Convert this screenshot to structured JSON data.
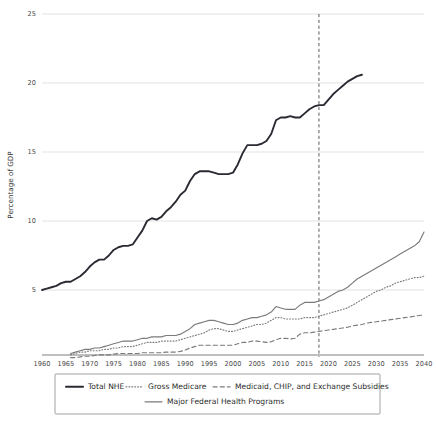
{
  "chart_data": {
    "type": "line",
    "title": "",
    "xlabel": "",
    "ylabel": "Percentage of GDP",
    "xlim": [
      1960,
      2040
    ],
    "ylim": [
      0,
      25
    ],
    "grid": true,
    "legend_position": "bottom",
    "y_ticks": [
      "5",
      "10",
      "15",
      "20",
      "25"
    ],
    "y_tick_values": [
      5,
      10,
      15,
      20,
      25
    ],
    "x_ticks": [
      "1960",
      "1965",
      "1970",
      "1975",
      "1980",
      "1985",
      "1990",
      "1995",
      "2000",
      "2005",
      "2010",
      "2015",
      "2020",
      "2025",
      "2030",
      "2035",
      "2040"
    ],
    "x_tick_values": [
      1960,
      1965,
      1970,
      1975,
      1980,
      1985,
      1990,
      1995,
      2000,
      2005,
      2010,
      2015,
      2020,
      2025,
      2030,
      2035,
      2040
    ],
    "annotations": [
      {
        "name": "projection-divider",
        "type": "vline",
        "x": 2018,
        "style": "dashed"
      }
    ],
    "series": [
      {
        "name": "Total NHE",
        "style": "solid",
        "color": "#2a2a33",
        "width": 1.9,
        "x": [
          1960,
          1961,
          1962,
          1963,
          1964,
          1965,
          1966,
          1967,
          1968,
          1969,
          1970,
          1971,
          1972,
          1973,
          1974,
          1975,
          1976,
          1977,
          1978,
          1979,
          1980,
          1981,
          1982,
          1983,
          1984,
          1985,
          1986,
          1987,
          1988,
          1989,
          1990,
          1991,
          1992,
          1993,
          1994,
          1995,
          1996,
          1997,
          1998,
          1999,
          2000,
          2001,
          2002,
          2003,
          2004,
          2005,
          2006,
          2007,
          2008,
          2009,
          2010,
          2011,
          2012,
          2013,
          2014,
          2015,
          2016,
          2017,
          2018,
          2019,
          2020,
          2021,
          2022,
          2023,
          2024,
          2025,
          2026,
          2027
        ],
        "values": [
          5.0,
          5.1,
          5.2,
          5.3,
          5.5,
          5.6,
          5.6,
          5.8,
          6.0,
          6.3,
          6.7,
          7.0,
          7.2,
          7.2,
          7.5,
          7.9,
          8.1,
          8.2,
          8.2,
          8.3,
          8.8,
          9.3,
          10.0,
          10.2,
          10.1,
          10.3,
          10.7,
          11.0,
          11.4,
          11.9,
          12.2,
          12.9,
          13.4,
          13.6,
          13.6,
          13.6,
          13.5,
          13.4,
          13.4,
          13.4,
          13.5,
          14.1,
          14.9,
          15.5,
          15.5,
          15.5,
          15.6,
          15.8,
          16.3,
          17.3,
          17.5,
          17.5,
          17.6,
          17.5,
          17.5,
          17.8,
          18.1,
          18.3,
          18.4,
          18.4,
          18.8,
          19.2,
          19.5,
          19.8,
          20.1,
          20.3,
          20.5,
          20.6
        ]
      },
      {
        "name": "Major Federal Health Programs",
        "style": "solid",
        "color": "#7b7b7b",
        "width": 1.15,
        "x": [
          1966,
          1967,
          1968,
          1969,
          1970,
          1971,
          1972,
          1973,
          1974,
          1975,
          1976,
          1977,
          1978,
          1979,
          1980,
          1981,
          1982,
          1983,
          1984,
          1985,
          1986,
          1987,
          1988,
          1989,
          1990,
          1991,
          1992,
          1993,
          1994,
          1995,
          1996,
          1997,
          1998,
          1999,
          2000,
          2001,
          2002,
          2003,
          2004,
          2005,
          2006,
          2007,
          2008,
          2009,
          2010,
          2011,
          2012,
          2013,
          2014,
          2015,
          2016,
          2017,
          2018,
          2019,
          2020,
          2021,
          2022,
          2023,
          2024,
          2025,
          2026,
          2027,
          2028,
          2029,
          2030,
          2031,
          2032,
          2033,
          2034,
          2035,
          2036,
          2037,
          2038,
          2039,
          2040
        ],
        "values": [
          0.4,
          0.5,
          0.6,
          0.7,
          0.7,
          0.8,
          0.8,
          0.9,
          1.0,
          1.1,
          1.2,
          1.3,
          1.3,
          1.3,
          1.4,
          1.5,
          1.5,
          1.6,
          1.6,
          1.6,
          1.7,
          1.7,
          1.7,
          1.8,
          2.0,
          2.2,
          2.5,
          2.6,
          2.7,
          2.8,
          2.8,
          2.7,
          2.6,
          2.5,
          2.5,
          2.6,
          2.8,
          2.9,
          3.0,
          3.0,
          3.1,
          3.2,
          3.4,
          3.8,
          3.7,
          3.6,
          3.6,
          3.6,
          3.9,
          4.1,
          4.1,
          4.1,
          4.2,
          4.3,
          4.5,
          4.7,
          4.9,
          5.0,
          5.2,
          5.5,
          5.8,
          6.0,
          6.2,
          6.4,
          6.6,
          6.8,
          7.0,
          7.2,
          7.4,
          7.6,
          7.8,
          8.0,
          8.2,
          8.5,
          9.2
        ]
      },
      {
        "name": "Gross Medicare",
        "style": "dotted",
        "color": "#7b7b7b",
        "width": 1.15,
        "x": [
          1966,
          1967,
          1968,
          1969,
          1970,
          1971,
          1972,
          1973,
          1974,
          1975,
          1976,
          1977,
          1978,
          1979,
          1980,
          1981,
          1982,
          1983,
          1984,
          1985,
          1986,
          1987,
          1988,
          1989,
          1990,
          1991,
          1992,
          1993,
          1994,
          1995,
          1996,
          1997,
          1998,
          1999,
          2000,
          2001,
          2002,
          2003,
          2004,
          2005,
          2006,
          2007,
          2008,
          2009,
          2010,
          2011,
          2012,
          2013,
          2014,
          2015,
          2016,
          2017,
          2018,
          2019,
          2020,
          2021,
          2022,
          2023,
          2024,
          2025,
          2026,
          2027,
          2028,
          2029,
          2030,
          2031,
          2032,
          2033,
          2034,
          2035,
          2036,
          2037,
          2038,
          2039,
          2040
        ],
        "values": [
          0.3,
          0.4,
          0.5,
          0.5,
          0.6,
          0.6,
          0.6,
          0.7,
          0.7,
          0.8,
          0.8,
          0.9,
          0.9,
          0.9,
          1.0,
          1.1,
          1.2,
          1.2,
          1.2,
          1.3,
          1.3,
          1.3,
          1.3,
          1.4,
          1.5,
          1.6,
          1.7,
          1.8,
          1.9,
          2.1,
          2.2,
          2.2,
          2.1,
          2.0,
          2.0,
          2.1,
          2.2,
          2.3,
          2.4,
          2.5,
          2.5,
          2.6,
          2.8,
          3.0,
          3.0,
          2.9,
          2.9,
          2.9,
          2.9,
          3.0,
          3.0,
          3.0,
          3.1,
          3.2,
          3.3,
          3.4,
          3.5,
          3.6,
          3.7,
          3.9,
          4.1,
          4.3,
          4.5,
          4.7,
          4.9,
          5.0,
          5.2,
          5.3,
          5.5,
          5.6,
          5.7,
          5.8,
          5.9,
          5.9,
          6.0
        ]
      },
      {
        "name": "Medicaid, CHIP, and Exchange Subsidies",
        "style": "dashed",
        "color": "#7b7b7b",
        "width": 1.15,
        "x": [
          1966,
          1967,
          1968,
          1969,
          1970,
          1971,
          1972,
          1973,
          1974,
          1975,
          1976,
          1977,
          1978,
          1979,
          1980,
          1981,
          1982,
          1983,
          1984,
          1985,
          1986,
          1987,
          1988,
          1989,
          1990,
          1991,
          1992,
          1993,
          1994,
          1995,
          1996,
          1997,
          1998,
          1999,
          2000,
          2001,
          2002,
          2003,
          2004,
          2005,
          2006,
          2007,
          2008,
          2009,
          2010,
          2011,
          2012,
          2013,
          2014,
          2015,
          2016,
          2017,
          2018,
          2019,
          2020,
          2021,
          2022,
          2023,
          2024,
          2025,
          2026,
          2027,
          2028,
          2029,
          2030,
          2031,
          2032,
          2033,
          2034,
          2035,
          2036,
          2037,
          2038,
          2039,
          2040
        ],
        "values": [
          0.1,
          0.1,
          0.15,
          0.2,
          0.2,
          0.25,
          0.3,
          0.3,
          0.3,
          0.35,
          0.4,
          0.4,
          0.4,
          0.4,
          0.4,
          0.45,
          0.45,
          0.45,
          0.45,
          0.45,
          0.5,
          0.5,
          0.5,
          0.55,
          0.65,
          0.8,
          0.9,
          1.0,
          1.0,
          1.0,
          1.0,
          1.0,
          1.0,
          1.0,
          1.0,
          1.1,
          1.2,
          1.2,
          1.3,
          1.3,
          1.25,
          1.2,
          1.25,
          1.4,
          1.5,
          1.5,
          1.45,
          1.5,
          1.8,
          1.9,
          1.9,
          1.95,
          2.0,
          2.05,
          2.1,
          2.15,
          2.2,
          2.25,
          2.3,
          2.4,
          2.45,
          2.5,
          2.6,
          2.65,
          2.7,
          2.75,
          2.8,
          2.85,
          2.9,
          2.95,
          3.0,
          3.05,
          3.1,
          3.15,
          3.2
        ]
      }
    ]
  },
  "axis": {
    "y_title": "Percentage of GDP"
  },
  "legend": {
    "entries": [
      {
        "label": "Total NHE",
        "style": "solid-bold"
      },
      {
        "label": "Gross Medicare",
        "style": "dotted"
      },
      {
        "label": "Medicaid, CHIP, and Exchange Subsidies",
        "style": "dashed"
      },
      {
        "label": "Major Federal Health Programs",
        "style": "solid-thin"
      }
    ]
  },
  "colors": {
    "total_nhe": "#2a2a33",
    "secondary": "#7b7b7b",
    "gridline": "#d9d9d9",
    "axis": "#6f6f6f",
    "text": "#333333",
    "background": "#ffffff"
  }
}
